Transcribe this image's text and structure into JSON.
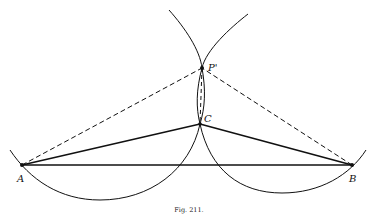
{
  "figure": {
    "caption": "Fig. 211.",
    "points": {
      "A": {
        "label": "A",
        "x": 22,
        "y": 165
      },
      "B": {
        "label": "B",
        "x": 352,
        "y": 165
      },
      "C": {
        "label": "C",
        "x": 200,
        "y": 124
      },
      "P": {
        "label": "P'",
        "x": 202,
        "y": 68
      }
    },
    "stroke_color": "#111111",
    "background": "#ffffff"
  }
}
